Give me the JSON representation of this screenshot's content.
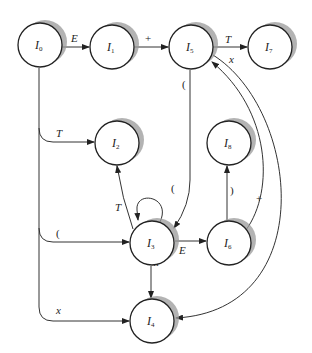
{
  "diagram": {
    "type": "state-transition-diagram",
    "nodes": [
      {
        "id": "I0",
        "prefix": "I",
        "sub": "0",
        "x": 40,
        "y": 45
      },
      {
        "id": "I1",
        "prefix": "I",
        "sub": "1",
        "x": 112,
        "y": 47
      },
      {
        "id": "I5",
        "prefix": "I",
        "sub": "5",
        "x": 191,
        "y": 47
      },
      {
        "id": "I7",
        "prefix": "I",
        "sub": "7",
        "x": 270,
        "y": 47
      },
      {
        "id": "I2",
        "prefix": "I",
        "sub": "2",
        "x": 117,
        "y": 143
      },
      {
        "id": "I8",
        "prefix": "I",
        "sub": "8",
        "x": 229,
        "y": 143
      },
      {
        "id": "I3",
        "prefix": "I",
        "sub": "3",
        "x": 152,
        "y": 243
      },
      {
        "id": "I6",
        "prefix": "I",
        "sub": "6",
        "x": 229,
        "y": 243
      },
      {
        "id": "I4",
        "prefix": "I",
        "sub": "4",
        "x": 152,
        "y": 321
      }
    ],
    "edges": [
      {
        "from": "I0",
        "to": "I1",
        "label": "E"
      },
      {
        "from": "I1",
        "to": "I5",
        "label": "+"
      },
      {
        "from": "I5",
        "to": "I7",
        "label": "T"
      },
      {
        "from": "I5",
        "to": "I4",
        "label": "x"
      },
      {
        "from": "I5",
        "to": "I3",
        "label": "("
      },
      {
        "from": "I0",
        "to": "I2",
        "label": "T"
      },
      {
        "from": "I0",
        "to": "I3",
        "label": "("
      },
      {
        "from": "I0",
        "to": "I4",
        "label": "x"
      },
      {
        "from": "I3",
        "to": "I2",
        "label": "T"
      },
      {
        "from": "I3",
        "to": "I3",
        "label": "("
      },
      {
        "from": "I3",
        "to": "I6",
        "label": "E"
      },
      {
        "from": "I3",
        "to": "I4",
        "label": "x"
      },
      {
        "from": "I6",
        "to": "I8",
        "label": ")"
      },
      {
        "from": "I6",
        "to": "I5",
        "label": "+"
      }
    ]
  },
  "labels": {
    "e_I0_I1": "E",
    "plus_I1_I5": "+",
    "t_I5_I7": "T",
    "x_I5_I4": "x",
    "paren_I5_I3": "(",
    "t_I0_I2": "T",
    "paren_I0_I3": "(",
    "x_I0_I4": "x",
    "t_I3_I2": "T",
    "paren_loop_I3": "(",
    "e_I3_I6": "E",
    "x_I3_I4": "x",
    "rparen_I6_I8": ")",
    "plus_I6_I5": "+"
  },
  "nodes": {
    "I0": {
      "prefix": "I",
      "sub": "0"
    },
    "I1": {
      "prefix": "I",
      "sub": "1"
    },
    "I2": {
      "prefix": "I",
      "sub": "2"
    },
    "I3": {
      "prefix": "I",
      "sub": "3"
    },
    "I4": {
      "prefix": "I",
      "sub": "4"
    },
    "I5": {
      "prefix": "I",
      "sub": "5"
    },
    "I6": {
      "prefix": "I",
      "sub": "6"
    },
    "I7": {
      "prefix": "I",
      "sub": "7"
    },
    "I8": {
      "prefix": "I",
      "sub": "8"
    }
  },
  "colors": {
    "stroke": "#222222",
    "shadow": "#9a9a9a",
    "background": "#ffffff"
  }
}
